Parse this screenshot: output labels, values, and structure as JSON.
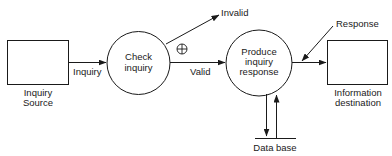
{
  "diagram": {
    "type": "data-flow-diagram",
    "colors": {
      "stroke": "#1a1a1a",
      "background": "#ffffff",
      "text": "#1a1a1a"
    },
    "entities": [
      {
        "id": "inquiry-source",
        "line1": "Inquiry",
        "line2": "Source"
      },
      {
        "id": "information-destination",
        "line1": "Information",
        "line2": "destination"
      }
    ],
    "processes": [
      {
        "id": "check-inquiry",
        "line1": "Check",
        "line2": "inquiry"
      },
      {
        "id": "produce-inquiry-response",
        "line1": "Produce",
        "line2": "inquiry",
        "line3": "response"
      }
    ],
    "store": {
      "id": "data-base",
      "label": "Data base"
    },
    "flows": {
      "inquiry": "Inquiry",
      "invalid": "Invalid",
      "valid": "Valid",
      "response": "Response"
    },
    "symbols": {
      "exclusive_or": "⊕"
    }
  }
}
